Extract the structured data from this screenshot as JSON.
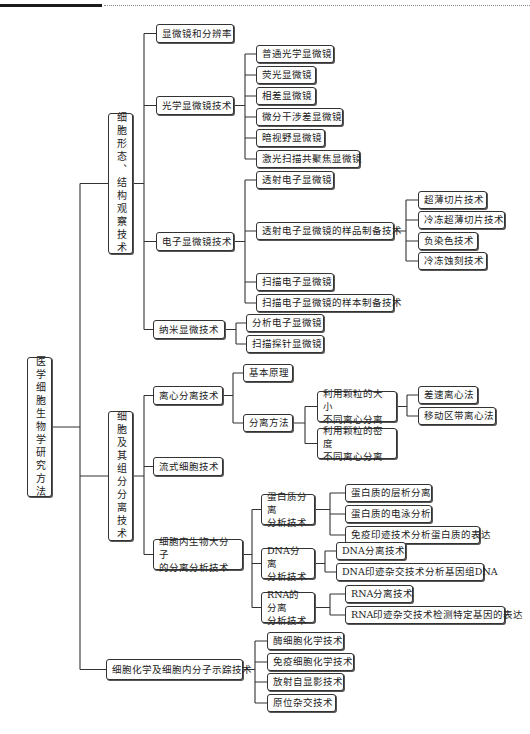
{
  "header": {
    "accent": "#1a1a1a"
  },
  "nodes": [
    {
      "id": "root",
      "label": "医学细胞生物学研究方法",
      "x": 27,
      "y": 357,
      "w": 25,
      "h": 140,
      "vert": true
    },
    {
      "id": "n1",
      "label": "细胞形态、结构观察技术",
      "x": 108,
      "y": 113,
      "w": 25,
      "h": 141,
      "vert": true
    },
    {
      "id": "n1a",
      "label": "显微镜和分辨率",
      "x": 156,
      "y": 24,
      "w": 78,
      "h": 19
    },
    {
      "id": "n1b",
      "label": "光学显微镜技术",
      "x": 156,
      "y": 96,
      "w": 78,
      "h": 19
    },
    {
      "id": "n1b1",
      "label": "普通光学显微镜",
      "x": 256,
      "y": 45,
      "w": 78,
      "h": 18
    },
    {
      "id": "n1b2",
      "label": "荧光显微镜",
      "x": 256,
      "y": 66,
      "w": 60,
      "h": 18
    },
    {
      "id": "n1b3",
      "label": "相差显微镜",
      "x": 256,
      "y": 87,
      "w": 60,
      "h": 18
    },
    {
      "id": "n1b4",
      "label": "微分干涉差显微镜",
      "x": 256,
      "y": 108,
      "w": 87,
      "h": 18
    },
    {
      "id": "n1b5",
      "label": "暗视野显微镜",
      "x": 256,
      "y": 129,
      "w": 69,
      "h": 18
    },
    {
      "id": "n1b6",
      "label": "激光扫描共聚焦显微镜",
      "x": 256,
      "y": 150,
      "w": 104,
      "h": 18
    },
    {
      "id": "n1c",
      "label": "电子显微镜技术",
      "x": 156,
      "y": 232,
      "w": 78,
      "h": 19
    },
    {
      "id": "n1c1",
      "label": "透射电子显微镜",
      "x": 256,
      "y": 171,
      "w": 78,
      "h": 18
    },
    {
      "id": "n1c2",
      "label": "透射电子显微镜的样品制备技术",
      "x": 256,
      "y": 222,
      "w": 138,
      "h": 18
    },
    {
      "id": "n1c2a",
      "label": "超薄切片技术",
      "x": 418,
      "y": 191,
      "w": 69,
      "h": 18
    },
    {
      "id": "n1c2b",
      "label": "冷冻超薄切片技术",
      "x": 418,
      "y": 211,
      "w": 87,
      "h": 18
    },
    {
      "id": "n1c2c",
      "label": "负染色技术",
      "x": 418,
      "y": 232,
      "w": 60,
      "h": 18
    },
    {
      "id": "n1c2d",
      "label": "冷冻蚀刻技术",
      "x": 418,
      "y": 252,
      "w": 69,
      "h": 18
    },
    {
      "id": "n1c3",
      "label": "扫描电子显微镜",
      "x": 256,
      "y": 273,
      "w": 78,
      "h": 18
    },
    {
      "id": "n1c4",
      "label": "扫描电子显微镜的样本制备技术",
      "x": 256,
      "y": 294,
      "w": 138,
      "h": 18
    },
    {
      "id": "n1d",
      "label": "纳米显微技术",
      "x": 153,
      "y": 320,
      "w": 72,
      "h": 19
    },
    {
      "id": "n1d1",
      "label": "分析电子显微镜",
      "x": 246,
      "y": 314,
      "w": 78,
      "h": 18
    },
    {
      "id": "n1d2",
      "label": "扫描探针显微镜",
      "x": 246,
      "y": 335,
      "w": 78,
      "h": 18
    },
    {
      "id": "n2",
      "label": "细胞及其组分分离技术",
      "x": 108,
      "y": 411,
      "w": 25,
      "h": 130,
      "vert": true
    },
    {
      "id": "n2a",
      "label": "离心分离技术",
      "x": 153,
      "y": 386,
      "w": 70,
      "h": 19
    },
    {
      "id": "n2a1",
      "label": "基本原理",
      "x": 243,
      "y": 364,
      "w": 50,
      "h": 18
    },
    {
      "id": "n2a2",
      "label": "分离方法",
      "x": 243,
      "y": 414,
      "w": 50,
      "h": 18
    },
    {
      "id": "n2a2a",
      "label": "利用颗粒的大小\n不同离心分离",
      "x": 317,
      "y": 391,
      "w": 80,
      "h": 31,
      "multi": true
    },
    {
      "id": "n2a2a1",
      "label": "差速离心法",
      "x": 418,
      "y": 386,
      "w": 60,
      "h": 18
    },
    {
      "id": "n2a2a2",
      "label": "移动区带离心法",
      "x": 418,
      "y": 407,
      "w": 78,
      "h": 18
    },
    {
      "id": "n2a2b",
      "label": "利用颗粒的密度\n不同离心分离",
      "x": 317,
      "y": 428,
      "w": 80,
      "h": 31,
      "multi": true
    },
    {
      "id": "n2b",
      "label": "流式细胞技术",
      "x": 153,
      "y": 457,
      "w": 70,
      "h": 19
    },
    {
      "id": "n2c",
      "label": "细胞内生物大分子\n的分离分析技术",
      "x": 153,
      "y": 539,
      "w": 90,
      "h": 31,
      "multi": true
    },
    {
      "id": "n2c1",
      "label": "蛋白质分离\n分析技术",
      "x": 261,
      "y": 494,
      "w": 54,
      "h": 31,
      "multi": true
    },
    {
      "id": "n2c1a",
      "label": "蛋白质的层析分离",
      "x": 345,
      "y": 484,
      "w": 87,
      "h": 18
    },
    {
      "id": "n2c1b",
      "label": "蛋白质的电泳分析",
      "x": 345,
      "y": 505,
      "w": 87,
      "h": 18
    },
    {
      "id": "n2c1c",
      "label": "免疫印迹技术分析蛋白质的表达",
      "x": 345,
      "y": 526,
      "w": 135,
      "h": 18
    },
    {
      "id": "n2c2",
      "label": "DNA分离\n分析技术",
      "x": 261,
      "y": 548,
      "w": 54,
      "h": 31,
      "multi": true
    },
    {
      "id": "n2c2a",
      "label": "DNA分离技术",
      "x": 336,
      "y": 542,
      "w": 70,
      "h": 18
    },
    {
      "id": "n2c2b",
      "label": "DNA印迹杂交技术分析基因组DNA",
      "x": 336,
      "y": 563,
      "w": 148,
      "h": 18
    },
    {
      "id": "n2c3",
      "label": "RNA的分离\n分析技术",
      "x": 261,
      "y": 592,
      "w": 54,
      "h": 31,
      "multi": true
    },
    {
      "id": "n2c3a",
      "label": "RNA分离技术",
      "x": 345,
      "y": 585,
      "w": 68,
      "h": 18
    },
    {
      "id": "n2c3b",
      "label": "RNA印迹杂交技术检测特定基因的表达",
      "x": 345,
      "y": 606,
      "w": 160,
      "h": 18
    },
    {
      "id": "n3",
      "label": "细胞化学及细胞内分子示踪技术",
      "x": 106,
      "y": 659,
      "w": 137,
      "h": 21
    },
    {
      "id": "n3a",
      "label": "酶细胞化学技术",
      "x": 267,
      "y": 632,
      "w": 77,
      "h": 18
    },
    {
      "id": "n3b",
      "label": "免疫细胞化学技术",
      "x": 267,
      "y": 653,
      "w": 87,
      "h": 18
    },
    {
      "id": "n3c",
      "label": "放射自显影技术",
      "x": 267,
      "y": 673,
      "w": 77,
      "h": 18
    },
    {
      "id": "n3d",
      "label": "原位杂交技术",
      "x": 267,
      "y": 694,
      "w": 69,
      "h": 18
    }
  ],
  "edges": [
    [
      "root",
      [
        "n1",
        "n2",
        "n3"
      ],
      80
    ],
    [
      "n1",
      [
        "n1a",
        "n1b",
        "n1c",
        "n1d"
      ],
      144
    ],
    [
      "n1b",
      [
        "n1b1",
        "n1b2",
        "n1b3",
        "n1b4",
        "n1b5",
        "n1b6"
      ],
      245
    ],
    [
      "n1c",
      [
        "n1c1",
        "n1c2",
        "n1c3",
        "n1c4"
      ],
      245
    ],
    [
      "n1c2",
      [
        "n1c2a",
        "n1c2b",
        "n1c2c",
        "n1c2d"
      ],
      406
    ],
    [
      "n1d",
      [
        "n1d1",
        "n1d2"
      ],
      236
    ],
    [
      "n2",
      [
        "n2a",
        "n2b",
        "n2c"
      ],
      144
    ],
    [
      "n2a",
      [
        "n2a1",
        "n2a2"
      ],
      233
    ],
    [
      "n2a2",
      [
        "n2a2a",
        "n2a2b"
      ],
      305
    ],
    [
      "n2a2a",
      [
        "n2a2a1",
        "n2a2a2"
      ],
      407
    ],
    [
      "n2c",
      [
        "n2c1",
        "n2c2",
        "n2c3"
      ],
      252
    ],
    [
      "n2c1",
      [
        "n2c1a",
        "n2c1b",
        "n2c1c"
      ],
      330
    ],
    [
      "n2c2",
      [
        "n2c2a",
        "n2c2b"
      ],
      325
    ],
    [
      "n2c3",
      [
        "n2c3a",
        "n2c3b"
      ],
      330
    ],
    [
      "n3",
      [
        "n3a",
        "n3b",
        "n3c",
        "n3d"
      ],
      255
    ]
  ]
}
